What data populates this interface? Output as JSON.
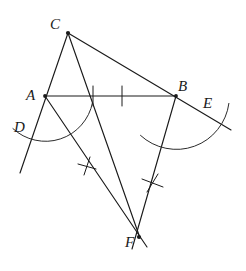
{
  "diagram": {
    "type": "euclidean-construction",
    "canvas": {
      "width": 246,
      "height": 271,
      "background": "#ffffff"
    },
    "stroke_color": "#1a1a1a",
    "arc_color": "#2b2b2b",
    "points": [
      {
        "id": "C",
        "label": "C",
        "x": 68,
        "y": 33,
        "label_x": 50,
        "label_y": 29
      },
      {
        "id": "A",
        "label": "A",
        "x": 45,
        "y": 96,
        "label_x": 26,
        "label_y": 100
      },
      {
        "id": "B",
        "label": "B",
        "x": 176,
        "y": 96,
        "label_x": 178,
        "label_y": 91
      },
      {
        "id": "D",
        "label": "D",
        "x": 33,
        "y": 126,
        "label_x": 14,
        "label_y": 132
      },
      {
        "id": "E",
        "label": "E",
        "x": 199,
        "y": 111,
        "label_x": 203,
        "label_y": 108
      },
      {
        "id": "F",
        "label": "F",
        "x": 139,
        "y": 237,
        "label_x": 125,
        "label_y": 247
      }
    ],
    "segments": [
      {
        "name": "line-C-to-D-extended",
        "from": "C",
        "to": "D-extension",
        "x1": 68,
        "y1": 33,
        "x2": 20,
        "y2": 173
      },
      {
        "name": "line-C-to-E-extended",
        "from": "C",
        "to": "E-extension",
        "x1": 68,
        "y1": 33,
        "x2": 231,
        "y2": 130
      },
      {
        "name": "segment-A-B",
        "from": "A",
        "to": "B",
        "x1": 45,
        "y1": 96,
        "x2": 176,
        "y2": 96
      },
      {
        "name": "segment-C-F",
        "from": "C",
        "to": "F",
        "x1": 68,
        "y1": 33,
        "x2": 140,
        "y2": 238
      },
      {
        "name": "bisector-A-to-F",
        "from": "A",
        "to": "F",
        "x1": 45,
        "y1": 96,
        "x2": 146,
        "y2": 246
      },
      {
        "name": "bisector-B-to-F",
        "from": "B",
        "to": "F",
        "x1": 176,
        "y1": 96,
        "x2": 133,
        "y2": 248
      }
    ],
    "arcs": [
      {
        "name": "arc-centered-at-A",
        "center": "A",
        "cx": 45,
        "cy": 96,
        "r": 48,
        "start_deg": 8,
        "end_deg": 132
      },
      {
        "name": "arc-centered-at-B",
        "center": "B",
        "cx": 176,
        "cy": 96,
        "r": 53,
        "start_deg": 48,
        "end_deg": 188
      }
    ],
    "tick_marks": [
      {
        "name": "cross-tick-on-bisector-A",
        "x": 87,
        "y": 166
      },
      {
        "name": "cross-tick-on-bisector-B",
        "x": 152,
        "y": 183
      },
      {
        "name": "arc-tick-on-AB-left",
        "x": 93,
        "y": 96
      },
      {
        "name": "arc-tick-on-AB-right",
        "x": 122,
        "y": 96
      }
    ]
  }
}
